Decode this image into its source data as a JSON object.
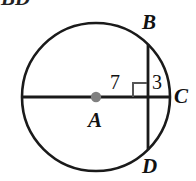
{
  "figure": {
    "type": "circle-geometry-diagram",
    "cut_off_caption": "BD",
    "stroke_color": "#1a1a1a",
    "center_dot_color": "#808080",
    "background": "#ffffff",
    "circle": {
      "center_label": "A",
      "center_x": 96,
      "center_y": 97,
      "radius": 74
    },
    "points": {
      "center": "A",
      "chord_top": "B",
      "chord_bottom": "D",
      "circle_right": "C"
    },
    "labels": {
      "A": "A",
      "B": "B",
      "C": "C",
      "D": "D"
    },
    "segments": {
      "from_center_to_chord": "7",
      "from_chord_to_circle": "3"
    },
    "right_angle_marker": {
      "present": true,
      "at": "intersection of diameter AC and chord BD"
    }
  }
}
